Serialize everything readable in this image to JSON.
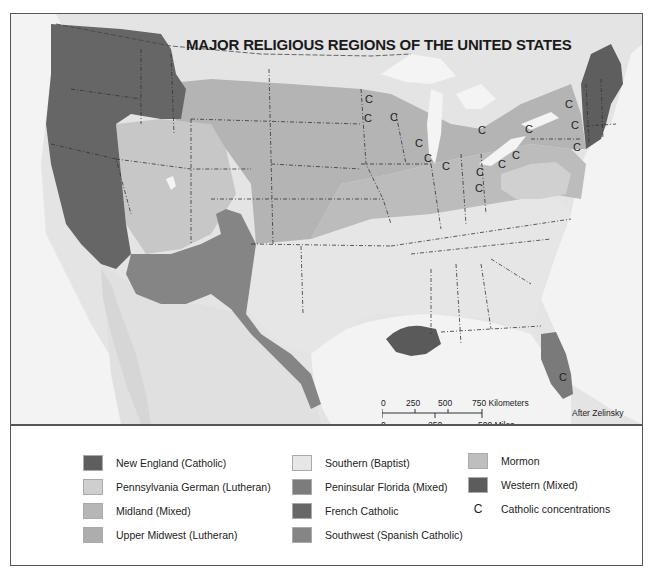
{
  "map": {
    "title": "MAJOR RELIGIOUS REGIONS OF THE UNITED STATES",
    "credit": "After Zelinsky",
    "catholic_marker": "C",
    "catholic_markers_count": 21,
    "scale_bar": {
      "km_ticks": [
        "0",
        "250",
        "500",
        "750 Kilometers"
      ],
      "mile_ticks": [
        "0",
        "250",
        "500 Miles"
      ]
    },
    "colors": {
      "background": "#e9e9e9",
      "water": "#f4f4f4",
      "new_england": "#5e5e5e",
      "western": "#676767",
      "french_catholic": "#5a5a5a",
      "southwest": "#858585",
      "peninsular_florida": "#7a7a7a",
      "mormon": "#c8c8c8",
      "upper_midwest": "#b2b2b2",
      "midland": "#bdbdbd",
      "pennsylvania_german": "#d0d0d0",
      "southern": "#e5e5e5",
      "non_us": "#e2e2e2"
    }
  },
  "legend": {
    "items": [
      {
        "label": "New England (Catholic)",
        "color": "#5e5e5e"
      },
      {
        "label": "Pennsylvania German (Lutheran)",
        "color": "#cfcfcf"
      },
      {
        "label": "Midland (Mixed)",
        "color": "#b6b6b6"
      },
      {
        "label": "Upper Midwest (Lutheran)",
        "color": "#adadad"
      },
      {
        "label": "Southern (Baptist)",
        "color": "#e6e6e6"
      },
      {
        "label": "Peninsular Florida (Mixed)",
        "color": "#7c7c7c"
      },
      {
        "label": "French Catholic",
        "color": "#676767"
      },
      {
        "label": "Southwest (Spanish Catholic)",
        "color": "#858585"
      },
      {
        "label": "Mormon",
        "color": "#bebebe"
      },
      {
        "label": "Western (Mixed)",
        "color": "#5c5c5c"
      },
      {
        "label": "Catholic concentrations",
        "symbol": "C"
      }
    ]
  }
}
